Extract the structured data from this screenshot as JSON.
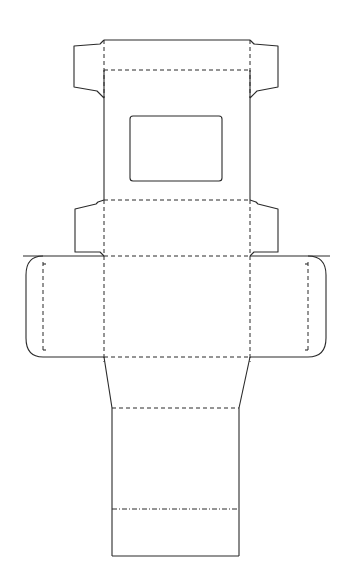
{
  "diagram": {
    "type": "packaging-dieline",
    "line_colors": {
      "stroke": "#2a2a2a",
      "background": "#ffffff"
    },
    "line_styles": {
      "cut": "solid",
      "fold": "dashed",
      "perforation": "dash-dot"
    },
    "panels": [
      {
        "name": "top-flap-panel",
        "x": [
          104,
          250
        ],
        "y": [
          40,
          70
        ]
      },
      {
        "name": "window-panel",
        "x": [
          104,
          250
        ],
        "y": [
          70,
          200
        ]
      },
      {
        "name": "lower-tuck-panel",
        "x": [
          104,
          250
        ],
        "y": [
          200,
          256
        ]
      },
      {
        "name": "main-front-panel",
        "x": [
          104,
          250
        ],
        "y": [
          256,
          357
        ]
      },
      {
        "name": "taper-panel",
        "x": [
          104,
          250
        ],
        "y": [
          357,
          408
        ]
      },
      {
        "name": "base-panel",
        "x": [
          112,
          239
        ],
        "y": [
          408,
          556
        ]
      }
    ],
    "window": {
      "x": 130,
      "y": 116,
      "width": 92,
      "height": 65
    },
    "side_flaps": [
      "top-left",
      "top-right",
      "middle-left",
      "middle-right",
      "side-left-rounded",
      "side-right-rounded"
    ],
    "perforation_line_y": 509
  }
}
